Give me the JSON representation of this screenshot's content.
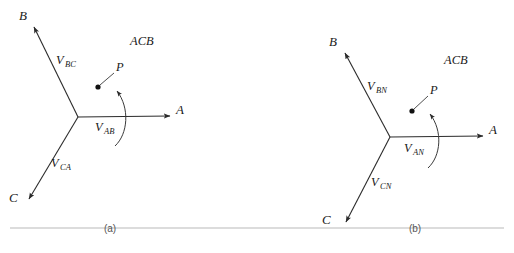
{
  "figure": {
    "type": "phasor-diagram-pair",
    "stroke_color": "#2b2b2b",
    "rule_color": "#b9b9b9"
  },
  "panels": [
    {
      "id": "a",
      "caption": "(a)",
      "sequence_label": "ACB",
      "rotation_point_label": "P",
      "axes": [
        {
          "name": "A",
          "label": "A",
          "angle_deg": 0
        },
        {
          "name": "B",
          "label": "B",
          "angle_deg": 125
        },
        {
          "name": "C",
          "label": "C",
          "angle_deg": 235
        }
      ],
      "phasors": [
        {
          "name": "V_AB",
          "base": "V",
          "sub": "AB"
        },
        {
          "name": "V_BC",
          "base": "V",
          "sub": "BC"
        },
        {
          "name": "V_CA",
          "base": "V",
          "sub": "CA"
        }
      ]
    },
    {
      "id": "b",
      "caption": "(b)",
      "sequence_label": "ACB",
      "rotation_point_label": "P",
      "axes": [
        {
          "name": "A",
          "label": "A",
          "angle_deg": 0
        },
        {
          "name": "B",
          "label": "B",
          "angle_deg": 125
        },
        {
          "name": "C",
          "label": "C",
          "angle_deg": 235
        }
      ],
      "phasors": [
        {
          "name": "V_AN",
          "base": "V",
          "sub": "AN"
        },
        {
          "name": "V_BN",
          "base": "V",
          "sub": "BN"
        },
        {
          "name": "V_CN",
          "base": "V",
          "sub": "CN"
        }
      ]
    }
  ]
}
